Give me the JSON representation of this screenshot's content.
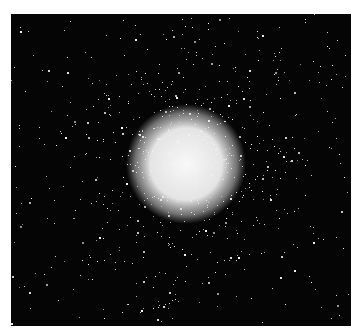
{
  "image": {
    "subject": "globular star cluster",
    "alt": "Black-and-white photograph of a dense globular star cluster against a dark sky",
    "background_color": "#050505",
    "core_color": "#f4f4f4",
    "frame_color": "#ffffff"
  }
}
